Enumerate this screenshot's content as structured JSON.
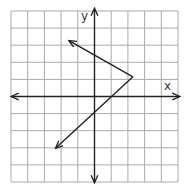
{
  "chart_data": {
    "type": "line",
    "title": "",
    "xlabel": "x",
    "ylabel": "y",
    "xlim": [
      -5,
      5
    ],
    "ylim": [
      -5,
      5
    ],
    "grid": true,
    "grid_step": 1,
    "legend": null,
    "series": [
      {
        "name": "piecewise-ray-graph",
        "description": "Two rays sharing a vertex, each ending in an arrowhead",
        "points": [
          {
            "x": -1.5,
            "y": 3.25,
            "arrow": true
          },
          {
            "x": 2.3,
            "y": 1.15,
            "arrow": false
          },
          {
            "x": -2.3,
            "y": -3.0,
            "arrow": true
          }
        ],
        "color": "#222222"
      }
    ],
    "annotations": {
      "lower_ray_x_intercept": 1,
      "lower_ray_y_intercept": -1,
      "upper_ray_y_intercept": 2.45
    }
  },
  "labels": {
    "x_axis": "x",
    "y_axis": "y"
  },
  "colors": {
    "grid": "#aaaaaa",
    "axis": "#222222",
    "line": "#222222",
    "background": "#ffffff"
  }
}
